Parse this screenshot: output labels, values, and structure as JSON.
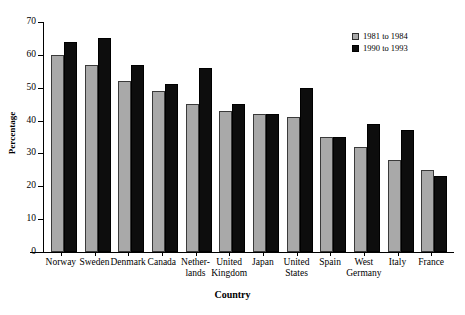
{
  "chart_data": {
    "type": "bar",
    "title": "",
    "xlabel": "Country",
    "ylabel": "Percentage",
    "ylim": [
      0,
      70
    ],
    "yticks": [
      0,
      10,
      20,
      30,
      40,
      50,
      60,
      70
    ],
    "grid": false,
    "legend_position": "top-right",
    "categories": [
      "Norway",
      "Sweden",
      "Denmark",
      "Canada",
      "Nether-\nlands",
      "United\nKingdom",
      "Japan",
      "United\nStates",
      "Spain",
      "West\nGermany",
      "Italy",
      "France"
    ],
    "series": [
      {
        "name": "1981 to 1984",
        "color": "#a9a9a9",
        "values": [
          60,
          57,
          52,
          49,
          45,
          43,
          42,
          41,
          35,
          32,
          28,
          25
        ]
      },
      {
        "name": "1990 to 1993",
        "color": "#0d0d0d",
        "values": [
          64,
          65,
          57,
          51,
          56,
          45,
          42,
          50,
          35,
          39,
          37,
          23
        ]
      }
    ]
  },
  "legend": {
    "items": [
      {
        "label": "1981 to 1984"
      },
      {
        "label": "1990 to 1993"
      }
    ]
  },
  "axes": {
    "y_title": "Percentage",
    "x_title": "Country"
  }
}
